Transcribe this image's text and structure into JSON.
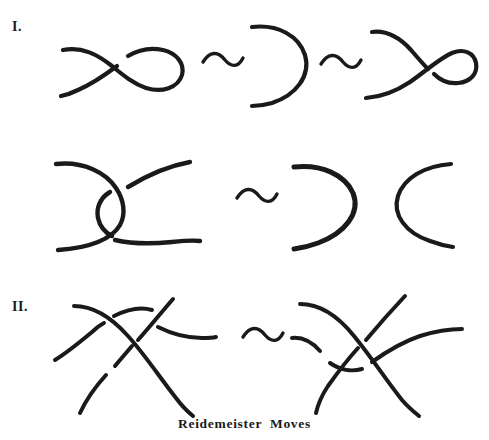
{
  "figure": {
    "caption": "Reidemeister  Moves",
    "ink_color": "#1a1a1a",
    "background_color": "#ffffff"
  },
  "rows": [
    {
      "label": "I.",
      "name": "reidemeister-move-one",
      "equivalence_symbols": [
        "~",
        "~"
      ],
      "panels": [
        {
          "name": "twisted-loop-left",
          "description": "strand with a positive kink (loop crossing)"
        },
        {
          "name": "straight-arc-middle",
          "description": "single unknotted arc bent like a right parenthesis"
        },
        {
          "name": "twisted-loop-right",
          "description": "strand with a negative kink (opposite loop crossing)"
        }
      ]
    },
    {
      "label": "II.",
      "name": "reidemeister-move-two",
      "equivalence_symbols": [
        "~"
      ],
      "panels": [
        {
          "name": "overlapping-arcs-left",
          "description": "two arcs overlapped forming two crossings"
        },
        {
          "name": "separated-arcs-right",
          "description": "two arcs pulled apart with no crossings"
        }
      ]
    },
    {
      "label": "III.",
      "name": "reidemeister-move-three",
      "equivalence_symbols": [
        "~"
      ],
      "panels": [
        {
          "name": "triple-crossing-left",
          "description": "three strands, horizontal strand passing above the crossing"
        },
        {
          "name": "triple-crossing-right",
          "description": "three strands, horizontal strand slid below the crossing"
        }
      ]
    }
  ]
}
